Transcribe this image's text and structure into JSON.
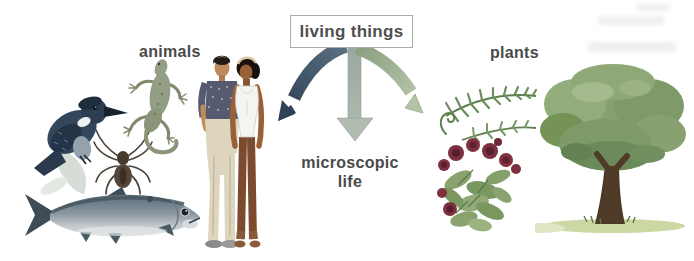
{
  "figure": {
    "type": "classification-diagram",
    "root": {
      "label": "living things"
    },
    "branches": [
      {
        "id": "animals",
        "label": "animals",
        "arrow_color": "#34465a",
        "examples": [
          "kingfisher-bird",
          "spider",
          "lizard",
          "man-and-woman",
          "fish"
        ]
      },
      {
        "id": "microscopic-life",
        "label": "microscopic life",
        "label_line1": "microscopic",
        "label_line2": "life",
        "arrow_color": "#a3b2ae"
      },
      {
        "id": "plants",
        "label": "plants",
        "arrow_color": "#a2b496",
        "examples": [
          "fern",
          "flowering-bush",
          "tree"
        ]
      }
    ]
  },
  "colors": {
    "background": "#ffffff",
    "label_text": "#4a4a4a",
    "box_border": "#a8aeae",
    "arrow_left_start": "#5d7183",
    "arrow_left_end": "#32455a",
    "arrow_center": "#a9b5ad",
    "arrow_right_start": "#8ba081",
    "arrow_right_end": "#b8c5ab",
    "tree_canopy": "#86a070",
    "flower_red": "#7c3040",
    "fern_green": "#6d8f5e"
  }
}
